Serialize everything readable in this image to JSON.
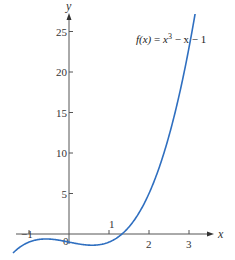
{
  "chart_data": {
    "type": "line",
    "title": "",
    "function_label": {
      "name": "f(x)",
      "equals": " = ",
      "expr_x": "x",
      "expr_exp": "3",
      "expr_rest": " − x − 1"
    },
    "xlabel": "x",
    "ylabel": "y",
    "xlim": [
      -1.4,
      3.4
    ],
    "ylim": [
      -2.5,
      27
    ],
    "x_ticks": [
      {
        "value": -1,
        "label": "−1"
      },
      {
        "value": 0,
        "label": "0"
      },
      {
        "value": 1,
        "label": "1"
      },
      {
        "value": 2,
        "label": "2"
      },
      {
        "value": 3,
        "label": "3"
      }
    ],
    "y_ticks": [
      {
        "value": 5,
        "label": "5"
      },
      {
        "value": 10,
        "label": "10"
      },
      {
        "value": 15,
        "label": "15"
      },
      {
        "value": 20,
        "label": "20"
      },
      {
        "value": 25,
        "label": "25"
      }
    ],
    "grid": false,
    "series": [
      {
        "name": "f(x) = x^3 - x - 1",
        "color": "#2f6fc0",
        "x": [
          -1.4,
          -1.2,
          -1.0,
          -0.8,
          -0.577,
          -0.4,
          -0.2,
          0.0,
          0.2,
          0.4,
          0.577,
          0.8,
          1.0,
          1.2,
          1.325,
          1.4,
          1.6,
          1.8,
          2.0,
          2.2,
          2.4,
          2.6,
          2.8,
          3.0,
          3.2
        ],
        "values": [
          -2.344,
          -0.528,
          -1.0,
          -0.712,
          -0.615,
          -0.664,
          -0.808,
          -1.0,
          -1.192,
          -1.336,
          -1.385,
          -1.288,
          -1.0,
          -0.472,
          0.0,
          0.344,
          1.496,
          3.032,
          5.0,
          7.448,
          10.424,
          13.976,
          18.152,
          23.0,
          28.568
        ]
      }
    ]
  },
  "colors": {
    "curve": "#2f6fc0",
    "axis": "#555555",
    "text": "#333333"
  }
}
